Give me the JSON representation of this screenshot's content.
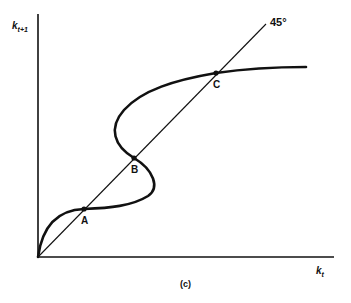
{
  "figure": {
    "panel_label": "(c)",
    "y_axis": {
      "symbol": "k",
      "subscript": "t+1"
    },
    "x_axis": {
      "symbol": "k",
      "subscript": "t"
    },
    "line_label": "45°",
    "points": [
      {
        "label": "A"
      },
      {
        "label": "B"
      },
      {
        "label": "C"
      }
    ],
    "colors": {
      "ink": "#111111",
      "background": "#ffffff"
    }
  }
}
